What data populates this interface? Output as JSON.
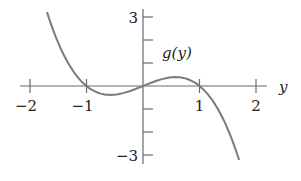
{
  "chart_data": {
    "type": "line",
    "title": "",
    "function_label": "g(y)",
    "xlabel": "y",
    "ylabel": "",
    "xlim": [
      -2,
      2
    ],
    "ylim": [
      -3,
      3
    ],
    "x_ticks": [
      -2,
      -1,
      0,
      1,
      2
    ],
    "x_tick_labels": [
      "−2",
      "−1",
      "",
      "1",
      "2"
    ],
    "y_ticks": [
      -3,
      -2,
      -1,
      0,
      1,
      2,
      3
    ],
    "y_tick_labels": [
      "−3",
      "",
      "",
      "",
      "",
      "",
      "3"
    ],
    "grid": false,
    "legend": null,
    "series": [
      {
        "name": "g(y)",
        "color": "#7a7a7a",
        "x": [
          -1.7,
          -1.5,
          -1.25,
          -1.0,
          -0.75,
          -0.577,
          -0.25,
          0,
          0.25,
          0.577,
          0.75,
          1.0,
          1.25,
          1.5,
          1.7
        ],
        "values": [
          3.21,
          1.88,
          0.7,
          0.0,
          -0.33,
          -0.38,
          -0.23,
          0.0,
          0.23,
          0.38,
          0.33,
          0.0,
          -0.7,
          -1.88,
          -3.21
        ]
      }
    ],
    "roots": [
      -1,
      0,
      1
    ]
  }
}
